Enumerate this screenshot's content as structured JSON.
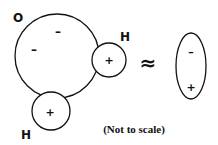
{
  "diagram": {
    "molecule": {
      "oxygen": {
        "label": "O",
        "charges": [
          "–",
          "–"
        ]
      },
      "hydrogens": [
        {
          "label": "H",
          "charge": "+"
        },
        {
          "label": "H",
          "charge": "+"
        }
      ]
    },
    "approx_symbol": "≈",
    "dipole": {
      "top_charge": "–",
      "bottom_charge": "+"
    },
    "caption": "(Not to scale)",
    "colors": {
      "stroke": "#111111",
      "background": "#ffffff"
    }
  }
}
